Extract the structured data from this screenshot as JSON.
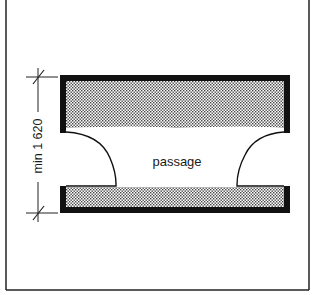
{
  "diagram": {
    "type": "architectural-plan",
    "passage_label": "passage",
    "dimension_label": "min 1 620",
    "colors": {
      "ink": "#111111",
      "background": "#ffffff",
      "stipple": "#555555"
    }
  }
}
